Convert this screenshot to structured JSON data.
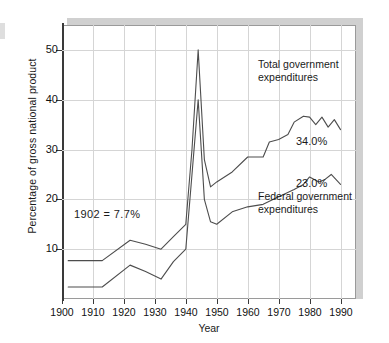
{
  "chart_data": {
    "type": "line",
    "title": "",
    "xlabel": "Year",
    "ylabel": "Percentage of gross national product",
    "xlim": [
      1900,
      1995
    ],
    "ylim": [
      0,
      55
    ],
    "xticks": [
      1900,
      1910,
      1920,
      1930,
      1940,
      1950,
      1960,
      1970,
      1980,
      1990
    ],
    "yticks": [
      10,
      20,
      30,
      40,
      50
    ],
    "grid": true,
    "legend_position": "inline-annotations",
    "series": [
      {
        "name": "Total government expenditures",
        "color": "#4d4d4d",
        "x": [
          1902,
          1913,
          1922,
          1927,
          1932,
          1936,
          1940,
          1942,
          1944,
          1946,
          1948,
          1950,
          1955,
          1960,
          1965,
          1967,
          1970,
          1973,
          1975,
          1978,
          1980,
          1982,
          1984,
          1986,
          1988,
          1990
        ],
        "y": [
          7.7,
          7.7,
          11.8,
          11.0,
          10.0,
          12.5,
          15.0,
          30.0,
          50.0,
          28.0,
          22.5,
          23.5,
          25.5,
          28.5,
          28.5,
          31.5,
          32.0,
          33.0,
          35.5,
          36.7,
          36.5,
          35.0,
          36.5,
          34.5,
          36.0,
          34.0
        ]
      },
      {
        "name": "Federal government expenditures",
        "color": "#4d4d4d",
        "x": [
          1902,
          1913,
          1922,
          1927,
          1932,
          1936,
          1940,
          1942,
          1944,
          1946,
          1948,
          1950,
          1955,
          1960,
          1965,
          1970,
          1975,
          1978,
          1980,
          1983,
          1985,
          1987,
          1990
        ],
        "y": [
          2.4,
          2.4,
          6.8,
          5.5,
          4.0,
          7.5,
          10.0,
          25.0,
          40.0,
          20.0,
          15.5,
          15.0,
          17.5,
          18.5,
          19.0,
          20.5,
          22.0,
          23.0,
          24.5,
          23.5,
          24.0,
          25.0,
          23.0
        ]
      }
    ],
    "annotations": [
      {
        "id": "baseline-note",
        "text": "1902  =  7.7%",
        "x": 1906,
        "y": 14.5
      },
      {
        "id": "total-label",
        "text": "Total government\nexpenditures",
        "x": 1972,
        "y": 43.5
      },
      {
        "id": "federal-label",
        "text": "Federal government\nexpenditures",
        "x": 1972,
        "y": 18.5
      },
      {
        "id": "total-value",
        "text": "34.0%",
        "x": 1982,
        "y": 30.0
      },
      {
        "id": "federal-value",
        "text": "23.0%",
        "x": 1982,
        "y": 21.5
      }
    ]
  },
  "axes": {
    "y_label": "Percentage of gross national product",
    "x_label": "Year",
    "y_tick_labels": [
      "50",
      "40",
      "30",
      "20",
      "10"
    ],
    "x_tick_labels": [
      "1900",
      "1910",
      "1920",
      "1930",
      "1940",
      "1950",
      "1960",
      "1970",
      "1980",
      "1990"
    ]
  },
  "annotations_text": {
    "baseline_note": "1902  =  7.7%",
    "total_label_line1": "Total government",
    "total_label_line2": "expenditures",
    "federal_label_line1": "Federal government",
    "federal_label_line2": "expenditures",
    "total_value": "34.0%",
    "federal_value": "23.0%"
  },
  "colors": {
    "line": "#4d4d4d",
    "grid": "#d5d5d5",
    "axis": "#3a3a3a",
    "shadow": "#d0d0d0",
    "background": "#ffffff"
  }
}
